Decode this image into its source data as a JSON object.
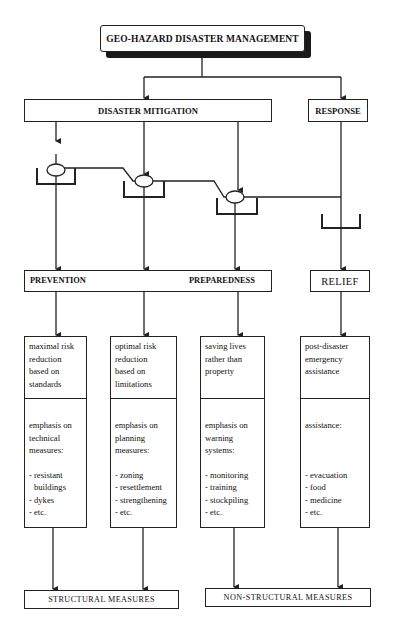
{
  "title": "GEO-HAZARD DISASTER MANAGEMENT",
  "level1": {
    "mitigation": "DISASTER MITIGATION",
    "response": "RESPONSE"
  },
  "level2": {
    "prevention": "PREVENTION",
    "preparedness": "PREPAREDNESS",
    "relief": "RELIEF"
  },
  "columns": [
    {
      "goal": [
        "maximal risk",
        "reduction",
        "based on",
        "standards"
      ],
      "emphasis": [
        "emphasis on",
        "technical",
        "measures:"
      ],
      "items": [
        "- resistant",
        "buildings",
        "- dykes",
        "- etc."
      ]
    },
    {
      "goal": [
        "optimal risk",
        "reduction",
        "based on",
        "limitations"
      ],
      "emphasis": [
        "emphasis on",
        "planning",
        "measures:"
      ],
      "items": [
        "- zoning",
        "- resettlement",
        "- strengthening",
        "- etc."
      ]
    },
    {
      "goal": [
        "saving lives",
        "rather than",
        "property"
      ],
      "emphasis": [
        "emphasis on",
        "warning",
        "systems:"
      ],
      "items": [
        "- monitoring",
        "- training",
        "- stockpiling",
        "- etc."
      ]
    },
    {
      "goal": [
        "post-disaster",
        "emergency",
        "assistance"
      ],
      "emphasis": [
        "assistance:"
      ],
      "items": [
        "- evacuation",
        "- food",
        "- medicine",
        "- etc."
      ]
    }
  ],
  "outcomes": {
    "structural": "STRUCTURAL MEASURES",
    "non_structural": "NON-STRUCTURAL MEASURES"
  },
  "icons": {
    "valve": "valve-icon",
    "cup": "bracket-cup-icon",
    "arrow": "arrow-down-icon"
  },
  "colors": {
    "line": "#222222",
    "background": "#ffffff",
    "shadow": "#1a1a1a"
  }
}
